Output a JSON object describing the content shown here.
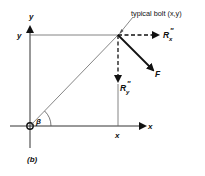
{
  "diagram": {
    "caption": "(b)",
    "axes": {
      "x_axis_label": "x",
      "y_axis_label": "y",
      "x_tick_label": "x",
      "y_tick_label": "y"
    },
    "bolt": {
      "annotation": "typical bolt (x,y)"
    },
    "angle_label": "β",
    "forces": {
      "rx": {
        "symbol": "R",
        "sub": "x",
        "sup": "″"
      },
      "ry": {
        "symbol": "R",
        "sub": "y",
        "sup": "″"
      },
      "f": {
        "symbol": "F"
      }
    },
    "colors": {
      "ink": "#111111",
      "line": "#555555",
      "background": "#ffffff"
    }
  }
}
